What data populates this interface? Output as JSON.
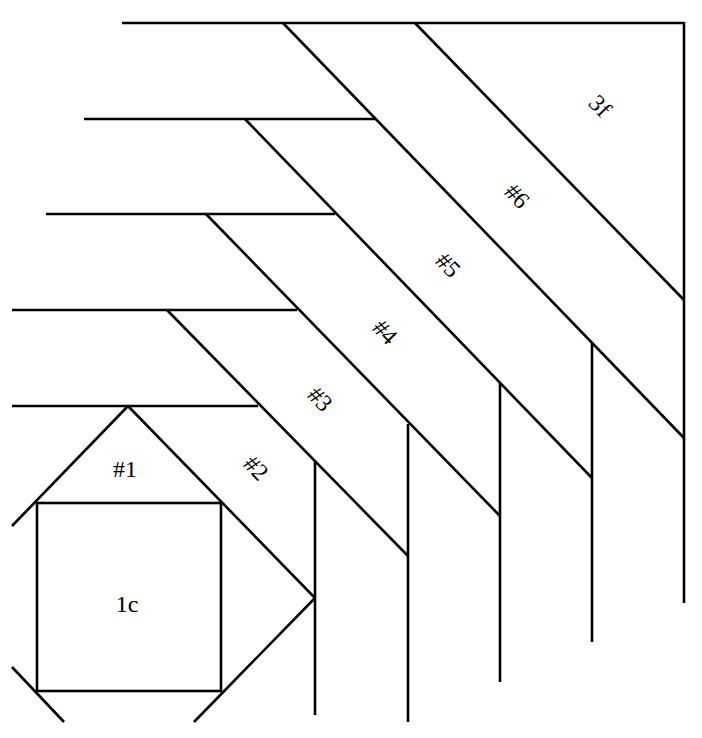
{
  "diagram": {
    "type": "quilt-block-piecing-pattern",
    "colors": {
      "line": "#000000",
      "background": "#ffffff"
    },
    "labels": {
      "center": "1c",
      "p1": "#1",
      "p2": "#2",
      "p3": "#3",
      "p4": "#4",
      "p5": "#5",
      "p6": "#6",
      "corner": "3f"
    }
  }
}
